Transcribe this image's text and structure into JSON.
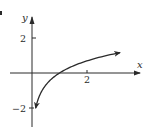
{
  "panel_label_fragment": "",
  "chart_data": {
    "type": "line",
    "title": "",
    "function": "y = ln x",
    "xlabel": "x",
    "ylabel": "y",
    "x_ticks": [
      {
        "value": 2,
        "label": "2"
      }
    ],
    "y_ticks": [
      {
        "value": 2,
        "label": "2"
      },
      {
        "value": -2,
        "label": "-2"
      }
    ],
    "xlim": [
      -1.1,
      3.9
    ],
    "ylim": [
      -3.1,
      3.5
    ],
    "grid": false,
    "legend": null,
    "series": [
      {
        "name": "ln x",
        "x": [
          0.135,
          0.2,
          0.3,
          0.5,
          0.75,
          1.0,
          1.5,
          2.0,
          2.5,
          3.2
        ],
        "y": [
          -2.0,
          -1.61,
          -1.2,
          -0.69,
          -0.29,
          0.0,
          0.41,
          0.69,
          0.92,
          1.16
        ],
        "arrows": "both ends"
      }
    ],
    "color": "#2a2a2a"
  },
  "labels": {
    "x_axis": "x",
    "y_axis": "y",
    "x_tick_2": "2",
    "y_tick_2": "2",
    "y_tick_neg2": "−2"
  }
}
